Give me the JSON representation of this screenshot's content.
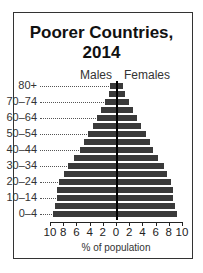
{
  "chart_data": {
    "type": "bar",
    "title": "Poorer Countries, 2014",
    "xlabel": "% of population",
    "ylabel": "",
    "legend": [
      "Males",
      "Females"
    ],
    "categories": [
      "0-4",
      "5-9",
      "10-14",
      "15-19",
      "20-24",
      "25-29",
      "30-34",
      "35-39",
      "40-44",
      "45-49",
      "50-54",
      "55-59",
      "60-64",
      "65-69",
      "70-74",
      "75-79",
      "80+"
    ],
    "y_tick_labels": [
      "0–4",
      "10–14",
      "20–24",
      "30–34",
      "40–44",
      "50–54",
      "60–64",
      "70–74",
      "80+"
    ],
    "x_tick_labels": [
      "10",
      "8",
      "6",
      "4",
      "2",
      "0",
      "2",
      "4",
      "6",
      "8",
      "10"
    ],
    "xlim": [
      -10,
      10
    ],
    "series": [
      {
        "name": "Males",
        "values": [
          9.6,
          9.3,
          9.0,
          8.9,
          8.6,
          7.9,
          7.3,
          6.3,
          5.5,
          4.9,
          4.3,
          3.5,
          2.9,
          2.2,
          1.7,
          1.1,
          0.9
        ]
      },
      {
        "name": "Females",
        "values": [
          9.3,
          9.0,
          8.7,
          8.6,
          8.3,
          7.8,
          7.2,
          6.3,
          5.6,
          5.1,
          4.5,
          3.8,
          3.2,
          2.5,
          1.9,
          1.3,
          1.1
        ]
      }
    ]
  }
}
